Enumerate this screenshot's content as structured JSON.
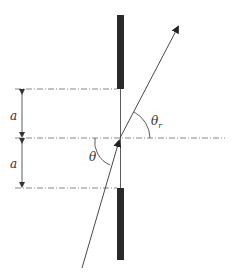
{
  "diagram": {
    "labels": {
      "a_upper": "a",
      "a_lower": "a",
      "theta": "θ",
      "theta_r_main": "θ",
      "theta_r_sub": "r"
    },
    "colors": {
      "screen": "#2a2a2a",
      "line": "#333333",
      "dash": "#555555",
      "background": "#ffffff"
    }
  }
}
